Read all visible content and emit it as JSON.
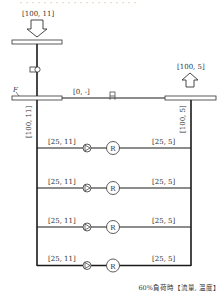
{
  "top_caption": "・・・・・・・・・・・・・・・・・・・・",
  "supply_inlet": {
    "label": "[100, 11]"
  },
  "return_outlet": {
    "label": "[100, 5]"
  },
  "left_header": {
    "tag": "F"
  },
  "bypass": {
    "label": "[0, -]"
  },
  "supply_main": {
    "label": "[100, 11]"
  },
  "return_main": {
    "label": "[100, 5]"
  },
  "branches": [
    {
      "supply_label": "[25, 11]",
      "return_label": "[25, 5]",
      "unit": "R"
    },
    {
      "supply_label": "[25, 11]",
      "return_label": "[25, 5]",
      "unit": "R"
    },
    {
      "supply_label": "[25, 11]",
      "return_label": "[25, 5]",
      "unit": "R"
    },
    {
      "supply_label": "[25, 11]",
      "return_label": "[25, 5]",
      "unit": "R"
    }
  ],
  "footer_caption": "60%負荷時【流量, 温度】",
  "colors": {
    "line": "#1a1a1a",
    "text": "#333333",
    "background": "#ffffff"
  }
}
